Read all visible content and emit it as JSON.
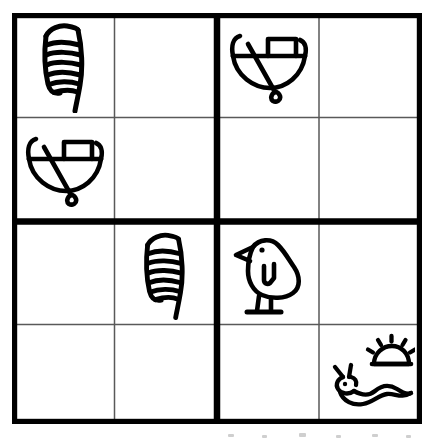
{
  "puzzle": {
    "title": "Hieroglyph Sudoku",
    "type": "sudoku",
    "size": 4,
    "box_rows": 2,
    "box_cols": 2,
    "symbol_set": [
      "feather",
      "boat",
      "bird",
      "snake-sun"
    ],
    "symbol_labels": {
      "feather": "feather",
      "boat": "boat",
      "bird": "bird",
      "snake-sun": "snake-sun",
      "empty": ""
    },
    "colors": {
      "ink": "#000000",
      "paper": "#ffffff",
      "thin_line": "#5a5a5a",
      "thick_line": "#000000"
    },
    "line_widths": {
      "thin": 1.4,
      "thick": 6.5,
      "border": 5.5
    },
    "grid": [
      [
        "feather",
        "empty",
        "boat",
        "empty"
      ],
      [
        "boat",
        "empty",
        "empty",
        "empty"
      ],
      [
        "empty",
        "feather",
        "bird",
        "empty"
      ],
      [
        "empty",
        "empty",
        "empty",
        "snake-sun"
      ]
    ],
    "cells": [
      {
        "row": 1,
        "col": 1,
        "symbol": "feather"
      },
      {
        "row": 1,
        "col": 2,
        "symbol": "empty"
      },
      {
        "row": 1,
        "col": 3,
        "symbol": "boat"
      },
      {
        "row": 1,
        "col": 4,
        "symbol": "empty"
      },
      {
        "row": 2,
        "col": 1,
        "symbol": "boat"
      },
      {
        "row": 2,
        "col": 2,
        "symbol": "empty"
      },
      {
        "row": 2,
        "col": 3,
        "symbol": "empty"
      },
      {
        "row": 2,
        "col": 4,
        "symbol": "empty"
      },
      {
        "row": 3,
        "col": 1,
        "symbol": "empty"
      },
      {
        "row": 3,
        "col": 2,
        "symbol": "feather"
      },
      {
        "row": 3,
        "col": 3,
        "symbol": "bird"
      },
      {
        "row": 3,
        "col": 4,
        "symbol": "empty"
      },
      {
        "row": 4,
        "col": 1,
        "symbol": "empty"
      },
      {
        "row": 4,
        "col": 2,
        "symbol": "empty"
      },
      {
        "row": 4,
        "col": 3,
        "symbol": "empty"
      },
      {
        "row": 4,
        "col": 4,
        "symbol": "snake-sun"
      }
    ]
  }
}
